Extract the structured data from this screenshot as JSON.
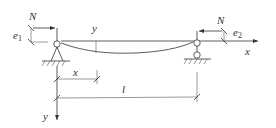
{
  "diagram": {
    "type": "beam-column with eccentric axial loads",
    "labels": {
      "load_left": "N",
      "load_right": "N",
      "ecc_left": "e",
      "ecc_left_sub": "1",
      "ecc_right": "e",
      "ecc_right_sub": "2",
      "deflection": "y",
      "x_axis": "x",
      "y_axis": "y",
      "position": "x",
      "span": "l"
    },
    "supports": [
      "pin (left)",
      "roller (right)"
    ],
    "colors": {
      "line": "#333333",
      "background": "#ffffff"
    }
  }
}
